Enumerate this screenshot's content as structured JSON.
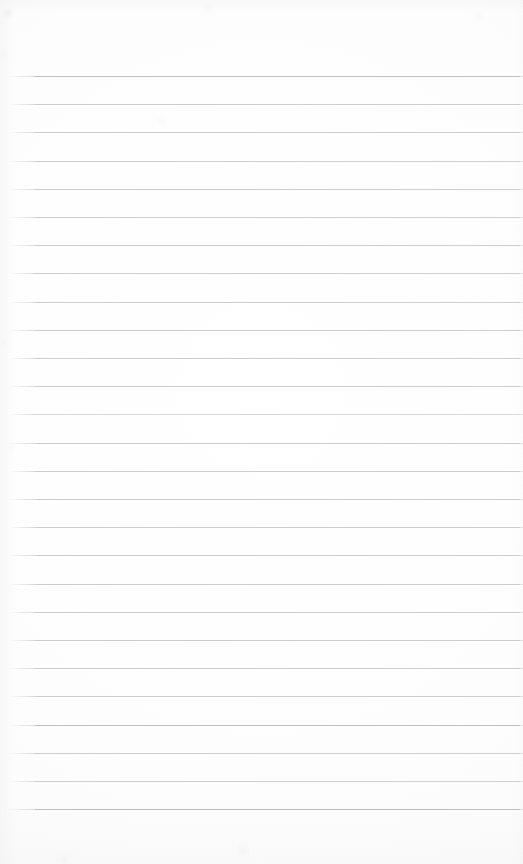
{
  "image": {
    "subject": "blank ruled notebook paper",
    "kind": "scanned-document-photo",
    "width": 523,
    "height": 864,
    "visible_text": "",
    "background_color": "#fdfdfd",
    "rule_color": "#c9c9ce",
    "handwriting": "none",
    "printed_content": "none"
  },
  "ruling": {
    "label": "horizontal ruled lines",
    "count": 27,
    "first_line_y": 76,
    "line_spacing": 28.2,
    "line_start_x": 35,
    "line_end_x": 520,
    "line_thickness": 1,
    "top_margin_height": 76,
    "bottom_margin_height": 56,
    "left_margin_width": 35,
    "vertical_margin_rule": "none",
    "lines_y": [
      76,
      104.2,
      132.4,
      160.6,
      188.8,
      217.0,
      245.2,
      273.4,
      301.6,
      329.8,
      358.0,
      386.2,
      414.4,
      442.6,
      470.8,
      499.0,
      527.2,
      555.4,
      583.6,
      611.8,
      640.0,
      668.2,
      696.4,
      724.6,
      752.8,
      781.0,
      809.2
    ],
    "line_weights": [
      "strong",
      "normal",
      "normal",
      "normal",
      "normal",
      "normal",
      "normal",
      "normal",
      "normal",
      "normal",
      "normal",
      "normal",
      "faint",
      "normal",
      "normal",
      "normal",
      "normal",
      "normal",
      "normal",
      "normal",
      "normal",
      "normal",
      "normal",
      "strong",
      "normal",
      "normal",
      "strong"
    ]
  },
  "specks": [
    {
      "x": 4,
      "y": 10,
      "size": 7,
      "opacity": 0.1
    },
    {
      "x": 2,
      "y": 52,
      "size": 5,
      "opacity": 0.07
    },
    {
      "x": 1,
      "y": 340,
      "size": 6,
      "opacity": 0.07
    },
    {
      "x": 9,
      "y": 445,
      "size": 4,
      "opacity": 0.06
    },
    {
      "x": 204,
      "y": 5,
      "size": 9,
      "opacity": 0.05
    },
    {
      "x": 474,
      "y": 12,
      "size": 8,
      "opacity": 0.05
    },
    {
      "x": 158,
      "y": 118,
      "size": 7,
      "opacity": 0.04
    },
    {
      "x": 238,
      "y": 845,
      "size": 10,
      "opacity": 0.05
    },
    {
      "x": 60,
      "y": 856,
      "size": 8,
      "opacity": 0.05
    }
  ]
}
